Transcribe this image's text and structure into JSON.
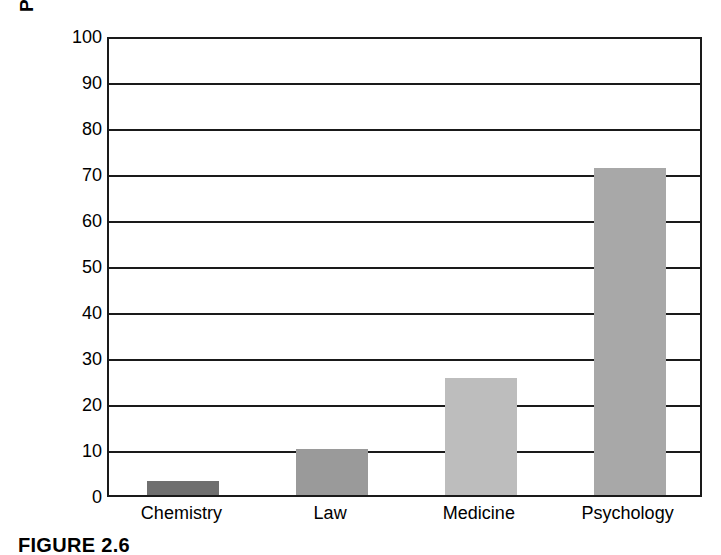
{
  "caption": "FIGURE 2.6",
  "chart_data": {
    "type": "bar",
    "title": "",
    "xlabel": "",
    "ylabel": "Percentage gain in statistical reasoning",
    "categories": [
      "Chemistry",
      "Law",
      "Medicine",
      "Psychology"
    ],
    "values": [
      3,
      10,
      25.5,
      71
    ],
    "series": [
      {
        "name": "Percentage gain in statistical reasoning",
        "values": [
          3,
          10,
          25.5,
          71
        ]
      }
    ],
    "ylim": [
      0,
      100
    ],
    "ytick_labels": [
      "0",
      "10",
      "20",
      "30",
      "40",
      "50",
      "60",
      "70",
      "80",
      "90",
      "100"
    ],
    "ytick_values": [
      0,
      10,
      20,
      30,
      40,
      50,
      60,
      70,
      80,
      90,
      100
    ],
    "grid": true,
    "grid_axis": "y",
    "legend": false,
    "legend_position": "none",
    "bar_colors": [
      "#6f6f6f",
      "#9a9a9a",
      "#bdbdbd",
      "#a8a8a8"
    ],
    "axis_color": "#1a1a1a",
    "background_color": "#ffffff"
  }
}
